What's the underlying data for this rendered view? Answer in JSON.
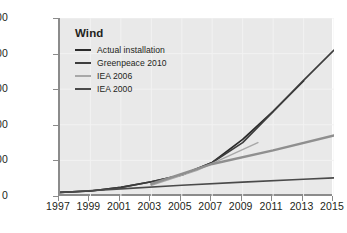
{
  "chart_data": {
    "type": "line",
    "title": "Wind",
    "xlabel": "",
    "ylabel": "Installed capacity in GW",
    "xlim": [
      1997,
      2015
    ],
    "ylim": [
      0,
      500
    ],
    "grid": true,
    "legend_position": "top-left inside plot",
    "x_tick_labels": [
      "1997",
      "1999",
      "2001",
      "2003",
      "2005",
      "2007",
      "2009",
      "2011",
      "2013",
      "2015"
    ],
    "y_tick_labels": [
      "0",
      "100",
      "200",
      "300",
      "400",
      "500"
    ],
    "x_ticks": [
      1997,
      1999,
      2001,
      2003,
      2005,
      2007,
      2009,
      2011,
      2013,
      2015
    ],
    "y_ticks": [
      0,
      100,
      200,
      300,
      400,
      500
    ],
    "series": [
      {
        "name": "Actual installation",
        "color": "#2a2a2a",
        "width": 1.7,
        "x": [
          1997,
          1999,
          2001,
          2003,
          2005,
          2007,
          2009,
          2011,
          2013
        ],
        "values": [
          10,
          14,
          24,
          40,
          59,
          94,
          159,
          238,
          323
        ]
      },
      {
        "name": "Greenpeace 2010",
        "color": "#3d3d3d",
        "width": 1.7,
        "x": [
          1997,
          1999,
          2001,
          2003,
          2005,
          2007,
          2009,
          2011,
          2013,
          2015
        ],
        "values": [
          10,
          14,
          24,
          40,
          59,
          94,
          150,
          237,
          325,
          410
        ]
      },
      {
        "name": "IEA 2006",
        "color": "#a8a8a8",
        "width": 1.5,
        "x": [
          2003,
          2006,
          2010
        ],
        "values": [
          30,
          72,
          150
        ]
      },
      {
        "name": "IEA 2006 long-term",
        "color": "#8f8f8f",
        "width": 2.4,
        "x": [
          2003,
          2007,
          2011,
          2015
        ],
        "values": [
          34,
          90,
          128,
          170
        ]
      },
      {
        "name": "IEA 2000",
        "color": "#4a4a4a",
        "width": 1.6,
        "x": [
          1997,
          2001,
          2005,
          2009,
          2013,
          2015
        ],
        "values": [
          10,
          20,
          30,
          39,
          47,
          51
        ]
      }
    ],
    "legend_entries": [
      {
        "label": "Actual installation",
        "color": "#2a2a2a"
      },
      {
        "label": "Greenpeace 2010",
        "color": "#3d3d3d"
      },
      {
        "label": "IEA 2006",
        "color": "#a8a8a8"
      },
      {
        "label": "IEA 2000",
        "color": "#4a4a4a"
      }
    ],
    "colors": {
      "plot_background": "#e9e9e9",
      "page_background": "#ffffff",
      "axis": "#8b8b8b",
      "gridline": "#f2f2f2",
      "text": "#231f20"
    }
  }
}
